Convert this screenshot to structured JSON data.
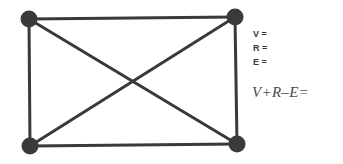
{
  "graph": {
    "vertices": [
      {
        "id": "top-left",
        "x": 29,
        "y": 19
      },
      {
        "id": "top-right",
        "x": 235,
        "y": 17
      },
      {
        "id": "bottom-left",
        "x": 30,
        "y": 146
      },
      {
        "id": "bottom-right",
        "x": 237,
        "y": 144
      }
    ],
    "edges": [
      [
        "top-left",
        "top-right"
      ],
      [
        "top-left",
        "bottom-left"
      ],
      [
        "top-right",
        "bottom-right"
      ],
      [
        "bottom-left",
        "bottom-right"
      ],
      [
        "top-left",
        "bottom-right"
      ],
      [
        "top-right",
        "bottom-left"
      ]
    ],
    "line_color": "#3a3a3a",
    "vertex_color": "#3a3a3a"
  },
  "labels": {
    "v": "V =",
    "r": "R =",
    "e": "E ="
  },
  "formula": "V+R–E="
}
